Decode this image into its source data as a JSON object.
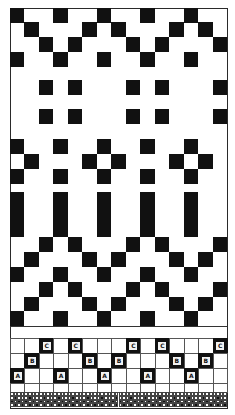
{
  "grid": {
    "columns": 15,
    "left": 10,
    "right": 227,
    "colors": {
      "background": "#ffffff",
      "ink": "#111111",
      "grid_line": "#555555"
    }
  },
  "motif_rows": [
    {
      "name": "zigzag-top-row-1",
      "top": 8,
      "height": 15,
      "black_cols": [
        0,
        3,
        6,
        9,
        12
      ]
    },
    {
      "name": "zigzag-top-row-2",
      "top": 22,
      "height": 15,
      "black_cols": [
        1,
        5,
        7,
        11,
        13
      ]
    },
    {
      "name": "zigzag-top-row-3",
      "top": 37,
      "height": 15,
      "black_cols": [
        2,
        4,
        8,
        10,
        14
      ]
    },
    {
      "name": "zigzag-top-row-4",
      "top": 52,
      "height": 15,
      "black_cols": [
        0,
        3,
        6,
        9,
        12
      ]
    },
    {
      "name": "dots-row-1",
      "top": 80,
      "height": 15,
      "black_cols": [
        2,
        4,
        8,
        10,
        14
      ]
    },
    {
      "name": "dots-row-2",
      "top": 109,
      "height": 15,
      "black_cols": [
        2,
        4,
        8,
        10,
        14
      ]
    },
    {
      "name": "cross-row-1",
      "top": 139,
      "height": 15,
      "black_cols": [
        0,
        3,
        6,
        9,
        12
      ]
    },
    {
      "name": "cross-row-2",
      "top": 154,
      "height": 15,
      "black_cols": [
        1,
        5,
        7,
        11,
        13
      ]
    },
    {
      "name": "cross-row-3",
      "top": 169,
      "height": 15,
      "black_cols": [
        0,
        3,
        6,
        9,
        12
      ]
    },
    {
      "name": "bars",
      "top": 192,
      "height": 45,
      "black_cols": [
        0,
        3,
        6,
        9,
        12
      ]
    },
    {
      "name": "zigzag-bottom-row-1",
      "top": 237,
      "height": 15,
      "black_cols": [
        2,
        4,
        8,
        10,
        14
      ]
    },
    {
      "name": "zigzag-bottom-row-2",
      "top": 252,
      "height": 15,
      "black_cols": [
        1,
        5,
        7,
        11,
        13
      ]
    },
    {
      "name": "zigzag-bottom-row-3",
      "top": 267,
      "height": 15,
      "black_cols": [
        0,
        3,
        6,
        9,
        12
      ]
    },
    {
      "name": "zigzag-bottom-row-4",
      "top": 282,
      "height": 15,
      "black_cols": [
        2,
        4,
        8,
        10,
        14
      ]
    },
    {
      "name": "zigzag-bottom-row-5",
      "top": 297,
      "height": 14,
      "black_cols": [
        1,
        5,
        7,
        11,
        13
      ]
    },
    {
      "name": "zigzag-bottom-row-6",
      "top": 311,
      "height": 15,
      "black_cols": [
        0,
        3,
        6,
        9,
        12
      ]
    }
  ],
  "separator_lines": [
    326,
    338
  ],
  "lettered_rows": [
    {
      "name": "row-c",
      "top": 338,
      "height": 15,
      "letter": "C",
      "black_cols": [
        2,
        4,
        8,
        10,
        14
      ]
    },
    {
      "name": "row-b",
      "top": 353,
      "height": 15,
      "letter": "B",
      "black_cols": [
        1,
        5,
        7,
        11,
        13
      ]
    },
    {
      "name": "row-a",
      "top": 368,
      "height": 15,
      "letter": "A",
      "black_cols": [
        0,
        3,
        6,
        9,
        12
      ]
    },
    {
      "name": "row-blank",
      "top": 383,
      "height": 9,
      "letter": "",
      "black_cols": []
    }
  ],
  "fine_border": {
    "top": 392,
    "rows": 4,
    "columns": 60,
    "cell_height": 3.75,
    "black_pattern": [
      [],
      [
        1,
        5,
        9,
        13,
        17,
        21,
        25,
        29,
        33,
        37,
        41,
        45,
        49,
        53,
        57
      ],
      [
        0,
        2,
        4,
        6,
        8,
        10,
        12,
        14,
        16,
        18,
        20,
        22,
        24,
        26,
        28,
        30,
        32,
        34,
        36,
        38,
        40,
        42,
        44,
        46,
        48,
        50,
        52,
        54,
        56,
        58
      ],
      [
        1,
        3,
        5,
        7,
        9,
        11,
        13,
        15,
        17,
        19,
        21,
        23,
        25,
        27,
        29,
        31,
        33,
        35,
        37,
        39,
        41,
        43,
        45,
        47,
        49,
        51,
        53,
        55,
        57,
        59
      ]
    ]
  }
}
